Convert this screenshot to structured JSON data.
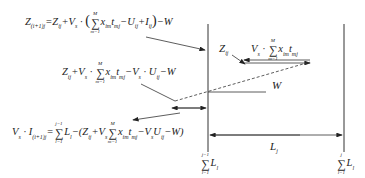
{
  "diagram": {
    "equations": {
      "top": {
        "lhs": "Z(ij+1)j",
        "text": "= Zij + Vs · ( Σ(m=1..M) xim tmj − Uij + Iij ) − W",
        "parts": [
          "Z",
          "(i+1)j",
          "=Z",
          "ij",
          "+V",
          "s",
          " · ",
          "x",
          "im",
          "t",
          "mj",
          "−U",
          "ij",
          "+I",
          "ij",
          "−W"
        ]
      },
      "middle": {
        "text": "Zij + Vs · Σ(m=1..M) xim tmj − Vs · Uij − W",
        "parts": [
          "Z",
          "ij",
          "+V",
          "s",
          " · ",
          "x",
          "im",
          "t",
          "mj",
          "−V",
          "s",
          " · U",
          "ij",
          "−W"
        ]
      },
      "bottom": {
        "text": "Vs · I(ij+1)j = Σ(l=1..j−1) Ll − ( Zij + Vs Σ(m=1..M) xim tmj − Vs Uij − W )",
        "parts": [
          "V",
          "s",
          " · I",
          "(i+1)j",
          "=",
          "L",
          "l",
          "−(Z",
          "ij",
          "+V",
          "s",
          "x",
          "im",
          "t",
          "mj",
          "−V",
          "s",
          "U",
          "ij",
          "−W)"
        ]
      }
    },
    "labels": {
      "z_ij": "Z",
      "z_ij_sub": "ij",
      "vs_sum": "Vs · Σ xim tmj",
      "w": "W",
      "l_j": "L",
      "l_j_sub": "j",
      "left_axis": "Σ(l=1..j−1) Ll",
      "right_axis": "Σ(l=1..j) Ll"
    },
    "sum_limits": {
      "m_upper": "M",
      "m_lower": "m=1",
      "l_upper_left": "j−1",
      "l_lower": "l=1",
      "l_upper_right": "j"
    }
  }
}
